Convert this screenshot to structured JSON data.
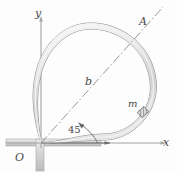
{
  "figure": {
    "labels": {
      "y_axis": "y",
      "x_axis": "x",
      "origin": "O",
      "point_a": "A",
      "radius_b": "b",
      "mass": "m",
      "angle_value": "45",
      "angle_unit": "°"
    },
    "colors": {
      "axis": "#9a9a9a",
      "tube_outline": "#8e8e8e",
      "tube_fill": "#dcdcdc",
      "tube_highlight": "#f2f2f2",
      "dash_dot": "#8c8c8c",
      "ground": "#c9c9c9",
      "mass_block": "#777777",
      "background": "#fdfdfd",
      "text": "#4a4a4a"
    },
    "geometry": {
      "origin_px": [
        41,
        143
      ],
      "point_a_px": [
        152,
        18
      ],
      "mass_px": [
        143,
        112
      ],
      "angle_deg": 45,
      "tube_top_px": [
        88,
        26
      ],
      "tube_right_px": [
        157,
        86
      ],
      "tube_left_px": [
        35,
        84
      ]
    }
  }
}
